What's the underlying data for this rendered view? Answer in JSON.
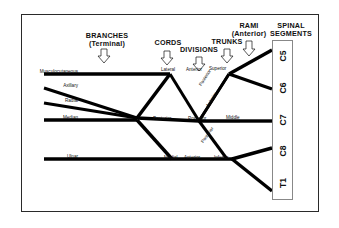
{
  "diagram": {
    "title_headers": [
      {
        "id": "branches",
        "line1": "BRANCHES",
        "line2": "(Terminal)",
        "x": 77,
        "y": 32,
        "w": 60,
        "arrow_x": 104,
        "arrow_y": 50
      },
      {
        "id": "cords",
        "line1": "CORDS",
        "line2": "",
        "x": 150,
        "y": 40,
        "w": 38,
        "arrow_x": 167,
        "arrow_y": 52
      },
      {
        "id": "divisions",
        "line1": "DIVISIONS",
        "line2": "",
        "x": 177,
        "y": 47,
        "w": 48,
        "arrow_x": 199,
        "arrow_y": 58
      },
      {
        "id": "trunks",
        "line1": "TRUNKS",
        "line2": "",
        "x": 209,
        "y": 39,
        "w": 40,
        "arrow_x": 227,
        "arrow_y": 50
      },
      {
        "id": "rami",
        "line1": "RAMI",
        "line2": "(Anterior)",
        "x": 228,
        "y": 24,
        "w": 44,
        "arrow_x": 249,
        "arrow_y": 42
      },
      {
        "id": "spinal-segments",
        "line1": "SPINAL",
        "line2": "SEGMENTS",
        "x": 266,
        "y": 24,
        "w": 52,
        "arrow_x": null,
        "arrow_y": null
      }
    ],
    "branch_labels": [
      {
        "name": "Musculocutaneous",
        "x": 28,
        "y": 70,
        "w": 50
      },
      {
        "name": "Axillary",
        "x": 38,
        "y": 85,
        "w": 40
      },
      {
        "name": "Radial",
        "x": 38,
        "y": 100,
        "w": 40
      },
      {
        "name": "Median",
        "x": 38,
        "y": 117,
        "w": 40
      },
      {
        "name": "Ulnar",
        "x": 38,
        "y": 155,
        "w": 40
      }
    ],
    "cord_labels": [
      {
        "name": "Lateral",
        "x": 161,
        "y": 68
      },
      {
        "name": "Posterior",
        "x": 155,
        "y": 117
      },
      {
        "name": "Medial",
        "x": 164,
        "y": 156
      }
    ],
    "division_labels": [
      {
        "name": "Anterior",
        "x": 188,
        "y": 68,
        "rot": 0
      },
      {
        "name": "Posterior",
        "x": 190,
        "y": 117,
        "rot": 0
      },
      {
        "name": "Anterior",
        "x": 185,
        "y": 156,
        "rot": 0
      },
      {
        "name": "Posterior",
        "x": 203,
        "y": 84,
        "rot": -55
      },
      {
        "name": "Anterior",
        "x": 211,
        "y": 101,
        "rot": -55
      },
      {
        "name": "Posterior",
        "x": 204,
        "y": 136,
        "rot": -62
      }
    ],
    "trunk_labels": [
      {
        "name": "Superior",
        "x": 211,
        "y": 67
      },
      {
        "name": "Middle",
        "x": 225,
        "y": 116
      },
      {
        "name": "Inferior",
        "x": 215,
        "y": 156
      }
    ],
    "spinal_segments": [
      {
        "name": "C5",
        "cy": 57
      },
      {
        "name": "C6",
        "cy": 89
      },
      {
        "name": "C7",
        "cy": 121
      },
      {
        "name": "C8",
        "cy": 152
      },
      {
        "name": "T1",
        "cy": 184
      }
    ],
    "colors": {
      "line": "#000000",
      "frame": "#2a2a2a",
      "segment_box": "#888888",
      "background": "#ffffff"
    }
  }
}
